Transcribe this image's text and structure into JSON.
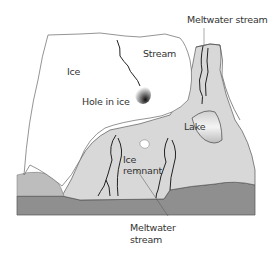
{
  "diagram": {
    "type": "glacial-landscape-block-diagram",
    "colors": {
      "ice": "#ffffff",
      "land_light": "#d9d9d9",
      "land_mid": "#bdbdbd",
      "bedrock": "#8f8f8f",
      "outline": "#555555",
      "stream": "#222222"
    },
    "labels": {
      "meltwater_stream_top": "Meltwater stream",
      "stream": "Stream",
      "ice": "Ice",
      "hole_in_ice": "Hole in ice",
      "lake": "Lake",
      "ice_remnant_line1": "Ice",
      "ice_remnant_line2": "remnant",
      "meltwater_stream_bottom_line1": "Meltwater",
      "meltwater_stream_bottom_line2": "stream"
    }
  }
}
